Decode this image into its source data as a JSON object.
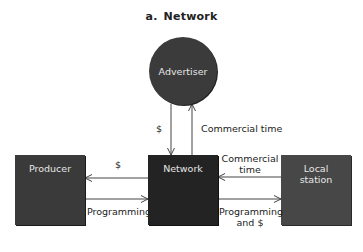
{
  "title": {
    "prefix": "a.",
    "text": "Network"
  },
  "nodes": {
    "advertiser": "Advertiser",
    "producer": "Producer",
    "network": "Network",
    "local_station_line1": "Local",
    "local_station_line2": "station"
  },
  "edges": {
    "network_to_advertiser_money": "$",
    "advertiser_commercial_time": "Commercial time",
    "network_to_producer_money": "$",
    "producer_programming": "Programming",
    "local_commercial_time_line1": "Commercial",
    "local_commercial_time_line2": "time",
    "network_programming_line1": "Programming",
    "network_programming_line2": "and $"
  },
  "colors": {
    "advertiser": "#3b3b3b",
    "producer": "#3a3a3a",
    "network": "#232323",
    "local_station": "#474747",
    "line": "#444444"
  }
}
